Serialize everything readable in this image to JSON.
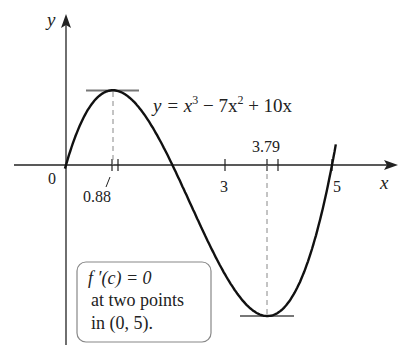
{
  "figure": {
    "function_label": {
      "prefix": "y = x",
      "exp1": "3",
      "mid": " − 7x",
      "exp2": "2",
      "suffix": " + 10x"
    },
    "axes": {
      "x_label": "x",
      "y_label": "y",
      "origin_label": "0"
    },
    "ticks": {
      "t088": "0.88",
      "t3": "3",
      "t379": "3.79",
      "t5": "5"
    },
    "note": {
      "line1": "f ′(c) = 0",
      "line2": "at two points",
      "line3": "in (0, 5)."
    },
    "colors": {
      "curve": "#111111",
      "axis": "#222222",
      "tangent": "#777777",
      "dashed": "#888888",
      "box_border": "#888888"
    }
  },
  "chart_data": {
    "type": "line",
    "title": "",
    "function": "y = x^3 - 7x^2 + 10x",
    "xlabel": "x",
    "ylabel": "y",
    "xlim": [
      0,
      5.5
    ],
    "x_ticks": [
      0.88,
      3,
      3.79,
      5
    ],
    "critical_points": [
      {
        "x": 0.88,
        "y": 4.06,
        "type": "local max",
        "tangent": "horizontal"
      },
      {
        "x": 3.79,
        "y": -8.21,
        "type": "local min",
        "tangent": "horizontal"
      }
    ],
    "roots": [
      0,
      2,
      5
    ],
    "annotations": [
      "f′(c) = 0 at two points in (0, 5)."
    ]
  }
}
